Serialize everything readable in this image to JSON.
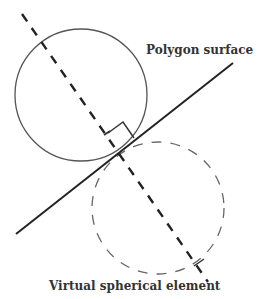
{
  "diagram": {
    "labels": {
      "polygon_surface": "Polygon surface",
      "virtual_element": "Virtual spherical element"
    },
    "colors": {
      "stroke": "#444444",
      "text": "#333333",
      "background": "#ffffff"
    }
  }
}
